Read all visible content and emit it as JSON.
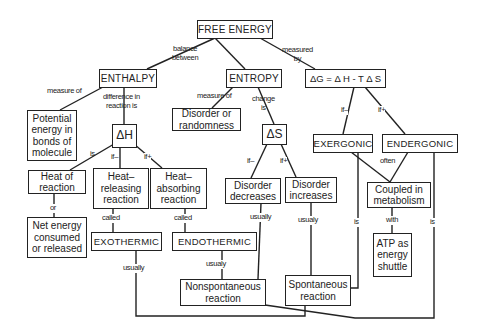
{
  "nodes": {
    "free_energy": "FREE ENERGY",
    "enthalpy": "ENTHALPY",
    "entropy": "ENTROPY",
    "gibbs_equation": "ΔG =  Δ H - T Δ S",
    "potential_energy": "Potential\nenergy in\nbonds of\nmolecule",
    "disorder_randomness": "Disorder or\nrandomness",
    "delta_h": "ΔH",
    "delta_s": "ΔS",
    "exergonic": "EXERGONIC",
    "endergonic": "ENDERGONIC",
    "heat_of_reaction": "Heat of\nreaction",
    "heat_releasing": "Heat–\nreleasing\nreaction",
    "heat_absorbing": "Heat–\nabsorbing\nreaction",
    "disorder_decreases": "Disorder\ndecreases",
    "disorder_increases": "Disorder\nincreases",
    "coupled_metabolism": "Coupled in\nmetabolism",
    "net_energy": "Net energy\nconsumed\nor released",
    "exothermic": "EXOTHERMIC",
    "endothermic": "ENDOTHERMIC",
    "atp_shuttle": "ATP as\nenergy\nshuttle",
    "nonspontaneous": "Nonspontaneous\nreaction",
    "spontaneous": "Spontaneous\nreaction"
  },
  "links": {
    "balance_between": "balance\nbetween",
    "measured_by": "measured\nby",
    "enthalpy_measure_of": "measure of",
    "difference_in_reaction": "difference in\nreaction is",
    "entropy_measure_of": "measure of",
    "change_is": "change\nis",
    "dh_is": "is",
    "dh_if_minus": "if–",
    "dh_if_plus": "if+",
    "ds_if_minus": "if–",
    "ds_if_plus": "if+",
    "dg_if_minus": "if–",
    "dg_if_plus": "if+",
    "or": "or",
    "called_exo": "called",
    "called_endo": "called",
    "often": "often",
    "with": "with",
    "exo_usually": "usually",
    "endo_usually": "usualy",
    "decreases_usually": "usually",
    "increases_usually": "usualy",
    "exergonic_is": "is",
    "endergonic_is": "is"
  }
}
